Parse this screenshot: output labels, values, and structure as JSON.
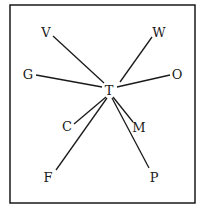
{
  "diagram": {
    "type": "star",
    "center": {
      "id": "T",
      "label": "T",
      "x": 109,
      "y": 90
    },
    "frame": {
      "x": 10,
      "y": 5,
      "width": 185,
      "height": 198
    },
    "nodes": [
      {
        "id": "V",
        "label": "V",
        "x": 46,
        "y": 32,
        "edge": [
          53,
          36,
          104,
          83
        ]
      },
      {
        "id": "W",
        "label": "W",
        "x": 159,
        "y": 32,
        "edge": [
          152,
          37,
          120,
          82
        ]
      },
      {
        "id": "G",
        "label": "G",
        "x": 28,
        "y": 74,
        "edge": [
          36,
          75,
          102,
          87
        ]
      },
      {
        "id": "O",
        "label": "O",
        "x": 177,
        "y": 74,
        "edge": [
          170,
          75,
          117,
          87
        ]
      },
      {
        "id": "C",
        "label": "C",
        "x": 67,
        "y": 126,
        "edge": [
          74,
          124,
          106,
          97
        ]
      },
      {
        "id": "M",
        "label": "M",
        "x": 139,
        "y": 127,
        "edge": [
          133,
          122,
          113,
          97
        ]
      },
      {
        "id": "F",
        "label": "F",
        "x": 48,
        "y": 177,
        "edge": [
          56,
          170,
          107,
          98
        ]
      },
      {
        "id": "P",
        "label": "P",
        "x": 154,
        "y": 177,
        "edge": [
          149,
          168,
          112,
          98
        ]
      }
    ],
    "edges": [
      [
        "T",
        "V"
      ],
      [
        "T",
        "W"
      ],
      [
        "T",
        "G"
      ],
      [
        "T",
        "O"
      ],
      [
        "T",
        "C"
      ],
      [
        "T",
        "M"
      ],
      [
        "T",
        "F"
      ],
      [
        "T",
        "P"
      ]
    ]
  }
}
